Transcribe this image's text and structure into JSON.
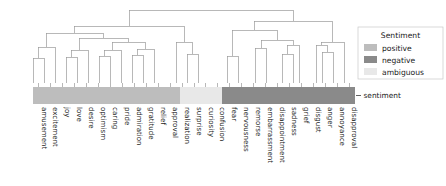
{
  "chart_data": {
    "type": "dendrogram",
    "title": "",
    "xlabel": "",
    "ylabel": "",
    "grid": false,
    "orientation": "top-down",
    "leaf_count": 24,
    "leaves": [
      {
        "label": "amusement",
        "sentiment": "positive"
      },
      {
        "label": "excitement",
        "sentiment": "positive"
      },
      {
        "label": "joy",
        "sentiment": "positive"
      },
      {
        "label": "love",
        "sentiment": "positive"
      },
      {
        "label": "desire",
        "sentiment": "positive"
      },
      {
        "label": "optimism",
        "sentiment": "positive"
      },
      {
        "label": "caring",
        "sentiment": "positive"
      },
      {
        "label": "pride",
        "sentiment": "positive"
      },
      {
        "label": "admiration",
        "sentiment": "positive"
      },
      {
        "label": "gratitude",
        "sentiment": "positive"
      },
      {
        "label": "relief",
        "sentiment": "positive"
      },
      {
        "label": "approval",
        "sentiment": "positive"
      },
      {
        "label": "realization",
        "sentiment": "ambiguous"
      },
      {
        "label": "surprise",
        "sentiment": "ambiguous"
      },
      {
        "label": "curiosity",
        "sentiment": "ambiguous"
      },
      {
        "label": "confusion",
        "sentiment": "ambiguous"
      },
      {
        "label": "fear",
        "sentiment": "negative"
      },
      {
        "label": "nervousness",
        "sentiment": "negative"
      },
      {
        "label": "remorse",
        "sentiment": "negative"
      },
      {
        "label": "embarrassment",
        "sentiment": "negative"
      },
      {
        "label": "disappointment",
        "sentiment": "negative"
      },
      {
        "label": "sadness",
        "sentiment": "negative"
      },
      {
        "label": "grief",
        "sentiment": "negative"
      },
      {
        "label": "disgust",
        "sentiment": "negative"
      },
      {
        "label": "anger",
        "sentiment": "negative"
      },
      {
        "label": "annoyance",
        "sentiment": "negative"
      },
      {
        "label": "disapproval",
        "sentiment": "negative"
      }
    ],
    "merges": [
      {
        "x1": 33,
        "x2": 44,
        "y": 58,
        "left_y": 83,
        "right_y": 83
      },
      {
        "x1": 38,
        "x2": 55,
        "y": 47,
        "left_y": 58,
        "right_y": 83
      },
      {
        "x1": 66,
        "x2": 77,
        "y": 57,
        "left_y": 83,
        "right_y": 83
      },
      {
        "x1": 71,
        "x2": 88,
        "y": 50,
        "left_y": 57,
        "right_y": 83
      },
      {
        "x1": 99,
        "x2": 110,
        "y": 56,
        "left_y": 83,
        "right_y": 83
      },
      {
        "x1": 104,
        "x2": 121,
        "y": 50,
        "left_y": 56,
        "right_y": 83
      },
      {
        "x1": 132,
        "x2": 143,
        "y": 55,
        "left_y": 83,
        "right_y": 83
      },
      {
        "x1": 137,
        "x2": 154,
        "y": 49,
        "left_y": 55,
        "right_y": 83
      },
      {
        "x1": 112,
        "x2": 145,
        "y": 42,
        "left_y": 50,
        "right_y": 49
      },
      {
        "x1": 79,
        "x2": 128,
        "y": 38,
        "left_y": 50,
        "right_y": 42
      },
      {
        "x1": 46,
        "x2": 103,
        "y": 33,
        "left_y": 47,
        "right_y": 38
      },
      {
        "x1": 187,
        "x2": 198,
        "y": 54,
        "left_y": 83,
        "right_y": 83
      },
      {
        "x1": 176,
        "x2": 192,
        "y": 42,
        "left_y": 83,
        "right_y": 54
      },
      {
        "x1": 74,
        "x2": 184,
        "y": 26,
        "left_y": 33,
        "right_y": 42
      },
      {
        "x1": 227,
        "x2": 238,
        "y": 56,
        "left_y": 83,
        "right_y": 83
      },
      {
        "x1": 255,
        "x2": 266,
        "y": 48,
        "left_y": 83,
        "right_y": 83
      },
      {
        "x1": 282,
        "x2": 293,
        "y": 54,
        "left_y": 83,
        "right_y": 83
      },
      {
        "x1": 287,
        "x2": 299,
        "y": 45,
        "left_y": 54,
        "right_y": 83
      },
      {
        "x1": 261,
        "x2": 293,
        "y": 40,
        "left_y": 48,
        "right_y": 45
      },
      {
        "x1": 232,
        "x2": 277,
        "y": 30,
        "left_y": 56,
        "right_y": 40
      },
      {
        "x1": 322,
        "x2": 333,
        "y": 52,
        "left_y": 83,
        "right_y": 83
      },
      {
        "x1": 316,
        "x2": 327,
        "y": 45,
        "left_y": 83,
        "right_y": 52
      },
      {
        "x1": 321,
        "x2": 344,
        "y": 42,
        "left_y": 45,
        "right_y": 83
      },
      {
        "x1": 254,
        "x2": 332,
        "y": 21,
        "left_y": 30,
        "right_y": 42
      },
      {
        "x1": 129,
        "x2": 293,
        "y": 10,
        "left_y": 26,
        "right_y": 21
      }
    ],
    "color_bar": {
      "row_label": "sentiment",
      "segments": [
        {
          "sentiment": "positive",
          "x": 33,
          "width": 147
        },
        {
          "sentiment": "ambiguous",
          "x": 180,
          "width": 42
        },
        {
          "sentiment": "negative",
          "x": 222,
          "width": 133
        }
      ]
    },
    "legend": {
      "title": "Sentiment",
      "position": "right",
      "entries": [
        {
          "label": "positive",
          "color": "#bdbdbd"
        },
        {
          "label": "negative",
          "color": "#8a8a8a"
        },
        {
          "label": "ambiguous",
          "color": "#e8e8e8"
        }
      ]
    },
    "colors": {
      "positive": "#bdbdbd",
      "negative": "#8a8a8a",
      "ambiguous": "#e8e8e8",
      "link": "#9a9a9a",
      "text": "#1a1a1a",
      "legend_border": "#c8c8c8",
      "background": "#ffffff"
    }
  }
}
